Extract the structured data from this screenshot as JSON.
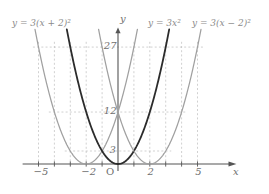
{
  "figure": {
    "background": "#ffffff",
    "curve_color_light": "#a0a0a0",
    "curve_color_dark": "#2b2b2b",
    "axis_color": "#555555",
    "grid_color": "#bdbdbd",
    "text_color": "#777777"
  },
  "labels": {
    "curve_left": "y = 3(x + 2)²",
    "curve_middle": "y = 3x²",
    "curve_right": "y = 3(x − 2)²",
    "x_axis_name": "x",
    "y_axis_name": "y",
    "origin": "O"
  },
  "chart_data": {
    "type": "line",
    "title": "",
    "xlabel": "x",
    "ylabel": "y",
    "xlim": [
      -6.2,
      6.4
    ],
    "ylim": [
      -2,
      33
    ],
    "grid": true,
    "grid_style": "dashed",
    "legend": "inline-curve-labels",
    "x_ticks": [
      -5,
      -2,
      0,
      2,
      5
    ],
    "x_tick_labels": [
      "−5",
      "−2",
      "O",
      "2",
      "5"
    ],
    "y_ticks": [
      3,
      12,
      27
    ],
    "y_tick_labels": [
      "3",
      "12",
      "27"
    ],
    "x_gridlines": [
      -5,
      -4,
      -3,
      -2,
      -1,
      1,
      2,
      3,
      4,
      5
    ],
    "y_gridlines": [
      3,
      12,
      27
    ],
    "series": [
      {
        "name": "y = 3(x + 2)²",
        "equation": "y = 3(x + 2)^2",
        "color": "#a0a0a0",
        "vertex": [
          -2,
          0
        ],
        "a": 3,
        "h": -2,
        "k": 0,
        "points": [
          {
            "x": -5,
            "y": 27
          },
          {
            "x": -4,
            "y": 12
          },
          {
            "x": -3,
            "y": 3
          },
          {
            "x": -2,
            "y": 0
          },
          {
            "x": -1,
            "y": 3
          },
          {
            "x": 0,
            "y": 12
          },
          {
            "x": 1,
            "y": 27
          }
        ]
      },
      {
        "name": "y = 3x²",
        "equation": "y = 3x^2",
        "color": "#2b2b2b",
        "vertex": [
          0,
          0
        ],
        "a": 3,
        "h": 0,
        "k": 0,
        "points": [
          {
            "x": -3,
            "y": 27
          },
          {
            "x": -2,
            "y": 12
          },
          {
            "x": -1,
            "y": 3
          },
          {
            "x": 0,
            "y": 0
          },
          {
            "x": 1,
            "y": 3
          },
          {
            "x": 2,
            "y": 12
          },
          {
            "x": 3,
            "y": 27
          }
        ]
      },
      {
        "name": "y = 3(x − 2)²",
        "equation": "y = 3(x - 2)^2",
        "color": "#a0a0a0",
        "vertex": [
          2,
          0
        ],
        "a": 3,
        "h": 2,
        "k": 0,
        "points": [
          {
            "x": -1,
            "y": 27
          },
          {
            "x": 0,
            "y": 12
          },
          {
            "x": 1,
            "y": 3
          },
          {
            "x": 2,
            "y": 0
          },
          {
            "x": 3,
            "y": 3
          },
          {
            "x": 4,
            "y": 12
          },
          {
            "x": 5,
            "y": 27
          }
        ]
      }
    ],
    "annotations": [
      {
        "text": "27",
        "x": 0,
        "y": 27,
        "placement": "left-of-axis"
      },
      {
        "text": "12",
        "x": 0,
        "y": 12,
        "placement": "left-of-axis"
      },
      {
        "text": "3",
        "x": 0,
        "y": 3,
        "placement": "left-of-axis"
      }
    ]
  }
}
